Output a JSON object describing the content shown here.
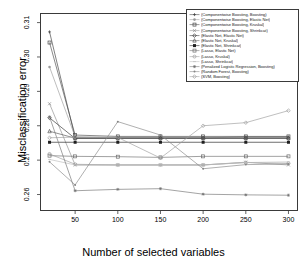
{
  "chart_data": {
    "type": "line",
    "title": "",
    "xlabel": "Number of selected variables",
    "ylabel": "Misclassification error",
    "xlim": [
      10,
      310
    ],
    "ylim": [
      0.2555,
      0.3125
    ],
    "xticks": [
      50,
      100,
      150,
      200,
      250,
      300
    ],
    "yticks": [
      0.26,
      0.27,
      0.28,
      0.29,
      0.3,
      0.31
    ],
    "xtick_labels": [
      "50",
      "100",
      "150",
      "200",
      "250",
      "300"
    ],
    "ytick_labels": [
      "0.26",
      "0.27",
      "0.28",
      "0.29",
      "0.30",
      "0.31"
    ],
    "grid": false,
    "legend_position": "top-right",
    "x": [
      20,
      50,
      100,
      150,
      200,
      250,
      300
    ],
    "series": [
      {
        "name": "(Componentwise Boosting, Boosting)",
        "color": "#3c3c3c",
        "marker": "plus",
        "values": [
          0.3073,
          0.2765,
          0.2765,
          0.2765,
          0.2765,
          0.2767,
          0.2767
        ]
      },
      {
        "name": "(Componentwise Boosting, Elastic Net)",
        "color": "#9a9a9a",
        "marker": "dot",
        "values": [
          0.2971,
          0.2768,
          0.2766,
          0.2766,
          0.2766,
          0.2766,
          0.2766
        ]
      },
      {
        "name": "(Componentwise Boosting, Kruskal)",
        "color": "#4a4a4a",
        "marker": "square",
        "values": [
          0.3042,
          0.2773,
          0.2769,
          0.2769,
          0.2769,
          0.2769,
          0.2769
        ]
      },
      {
        "name": "(Componentwise Boosting, Shrinkcat)",
        "color": "#8c8c8c",
        "marker": "cross",
        "values": [
          0.2864,
          0.2686,
          0.2686,
          0.2686,
          0.2686,
          0.2694,
          0.2686
        ]
      },
      {
        "name": "(Elastic Net, Elastic Net)",
        "color": "#2e2e2e",
        "marker": "diamond",
        "values": [
          0.2823,
          0.2763,
          0.2763,
          0.2763,
          0.2763,
          0.2763,
          0.2763
        ]
      },
      {
        "name": "(Elastic Net, Kruskal)",
        "color": "#565656",
        "marker": "triangle",
        "values": [
          0.2784,
          0.2764,
          0.2764,
          0.2764,
          0.2764,
          0.2764,
          0.2764
        ]
      },
      {
        "name": "(Elastic Net, Shrinkcat)",
        "color": "#1f1f1f",
        "marker": "filled-square",
        "values": [
          0.2752,
          0.2752,
          0.2752,
          0.2752,
          0.2752,
          0.2752,
          0.2752
        ]
      },
      {
        "name": "(Lasso, Elastic Net)",
        "color": "#6e6e6e",
        "marker": "open-square",
        "values": [
          0.2713,
          0.2711,
          0.271,
          0.2708,
          0.2711,
          0.2711,
          0.2711
        ]
      },
      {
        "name": "(Lasso, Kruskal)",
        "color": "#9e9e9e",
        "marker": "open-circle",
        "values": [
          0.2718,
          0.2688,
          0.2686,
          0.2686,
          0.2686,
          0.2693,
          0.2691
        ]
      },
      {
        "name": "(Lasso, Shrinkcat)",
        "color": "#bdbdbd",
        "marker": "tick",
        "values": [
          0.2702,
          0.2686,
          0.2686,
          0.2686,
          0.2686,
          0.2693,
          0.2695
        ]
      },
      {
        "name": "(Penalized Logistic Regression, Boosting)",
        "color": "#727272",
        "marker": "star",
        "values": [
          0.2826,
          0.2611,
          0.2615,
          0.2617,
          0.2601,
          0.2599,
          0.2598
        ]
      },
      {
        "name": "(Random Forest, Boosting)",
        "color": "#858585",
        "marker": "small-dot",
        "values": [
          0.2695,
          0.2628,
          0.2812,
          0.2773,
          0.2675,
          0.2687,
          0.2689
        ]
      },
      {
        "name": "(SVM, Boosting)",
        "color": "#9c9c9c",
        "marker": "open-diamond",
        "values": [
          0.2765,
          0.2767,
          0.2766,
          0.2706,
          0.28,
          0.2809,
          0.2844
        ]
      }
    ]
  },
  "legend": {
    "entries": [
      "(Componentwise Boosting, Boosting)",
      "(Componentwise Boosting, Elastic Net)",
      "(Componentwise Boosting, Kruskal)",
      "(Componentwise Boosting, Shrinkcat)",
      "(Elastic Net, Elastic Net)",
      "(Elastic Net, Kruskal)",
      "(Elastic Net, Shrinkcat)",
      "(Lasso, Elastic Net)",
      "(Lasso, Kruskal)",
      "(Lasso, Shrinkcat)",
      "(Penalized Logistic Regression, Boosting)",
      "(Random Forest, Boosting)",
      "(SVM, Boosting)"
    ]
  }
}
